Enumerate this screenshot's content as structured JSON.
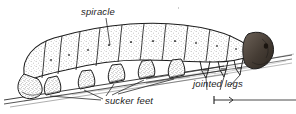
{
  "figure": {
    "kind": "scientific-line-drawing",
    "background_color": "#ffffff",
    "ink_color": "#1d1d1d",
    "stipple_color": "#555555",
    "head_shade_color": "#4a4038",
    "labels": [
      {
        "id": "spiracle",
        "text": "spiracle",
        "style": "italic"
      },
      {
        "id": "sucker-feet",
        "text": "sucker feet",
        "style": "italic"
      },
      {
        "id": "jointed-legs",
        "text": "jointed legs",
        "style": "italic"
      }
    ],
    "scale_bar": {
      "id": "scale-arrow",
      "description": "short right-pointing arrow with tick at left, followed by a long horizontal rule",
      "label": ""
    },
    "clipped_text_above": "",
    "body": {
      "segment_count": 10,
      "sucker_feet_count": 5,
      "jointed_legs_count": 3
    }
  }
}
